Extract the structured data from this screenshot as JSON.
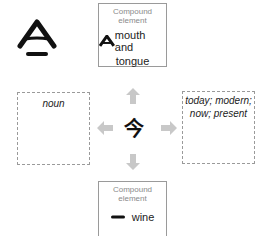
{
  "center": {
    "character": "今"
  },
  "top_box": {
    "caption": "Compound element",
    "meaning_line1": "mouth and",
    "meaning_line2": "tongue",
    "glyph": "mouth-tongue-glyph"
  },
  "bottom_box": {
    "caption": "Compound element",
    "meaning": "wine",
    "glyph": "horizontal-stroke-glyph"
  },
  "left_box": {
    "label": "noun"
  },
  "right_box": {
    "label_line1": "today; modern;",
    "label_line2": "now; present"
  },
  "ancient_form": {
    "glyph": "ancient-jin-glyph"
  },
  "colors": {
    "arrow": "#c8c8c8",
    "box_border": "#9a9a9a",
    "caption": "#8a8a8a",
    "ink": "#111111"
  }
}
